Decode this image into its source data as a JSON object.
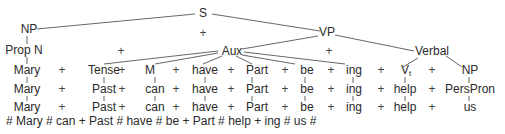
{
  "diagram": {
    "type": "phrase-structure-tree",
    "nodes": {
      "S": "S",
      "NP": "NP",
      "VP": "VP",
      "PropN": "Prop N",
      "Aux": "Aux",
      "Verbal": "Verbal"
    },
    "plus": "+",
    "rows": [
      {
        "items": [
          "Mary",
          "Tense",
          "M",
          "have",
          "Part",
          "be",
          "ing",
          "V",
          "NP"
        ],
        "subscripts": {
          "7": "t"
        }
      },
      {
        "items": [
          "Mary",
          "Past",
          "can",
          "have",
          "Part",
          "be",
          "ing",
          "help",
          "PersPron"
        ]
      },
      {
        "items": [
          "Mary",
          "Past",
          "can",
          "have",
          "Part",
          "be",
          "ing",
          "help",
          "us"
        ]
      }
    ],
    "final_string": "# Mary # can + Past # have # be + Part # help + ing # us #"
  }
}
